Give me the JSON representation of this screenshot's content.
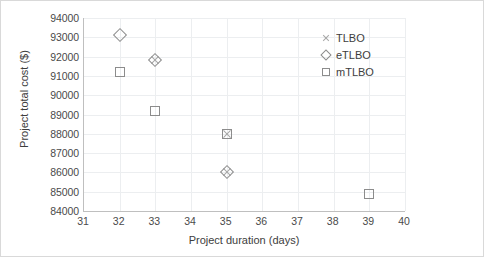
{
  "chart_data": {
    "type": "scatter",
    "title": "",
    "xlabel": "Project duration (days)",
    "ylabel": "Project total cost ($)",
    "xlim": [
      31,
      40
    ],
    "ylim": [
      84000,
      94000
    ],
    "xticks": [
      31,
      32,
      33,
      34,
      35,
      36,
      37,
      38,
      39,
      40
    ],
    "yticks": [
      84000,
      85000,
      86000,
      87000,
      88000,
      89000,
      90000,
      91000,
      92000,
      93000,
      94000
    ],
    "grid": true,
    "legend_position": "upper right",
    "series": [
      {
        "name": "TLBO",
        "marker": "x",
        "color": "#a6a6a6",
        "points": [
          {
            "x": 33,
            "y": 91800
          },
          {
            "x": 35,
            "y": 88000
          },
          {
            "x": 35,
            "y": 86000
          }
        ]
      },
      {
        "name": "eTLBO",
        "marker": "diamond",
        "color": "#8c8c8c",
        "points": [
          {
            "x": 32,
            "y": 93100
          },
          {
            "x": 33,
            "y": 91800
          },
          {
            "x": 35,
            "y": 86000
          }
        ]
      },
      {
        "name": "mTLBO",
        "marker": "square",
        "color": "#8c8c8c",
        "points": [
          {
            "x": 32,
            "y": 91200
          },
          {
            "x": 33,
            "y": 89200
          },
          {
            "x": 35,
            "y": 88000
          },
          {
            "x": 39,
            "y": 84900
          }
        ]
      }
    ]
  }
}
